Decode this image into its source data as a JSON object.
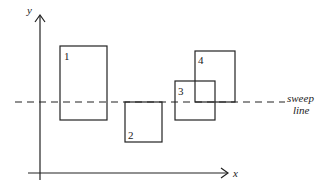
{
  "diagram": {
    "type": "sweep-line-rectangles",
    "axes": {
      "x_label": "x",
      "y_label": "y"
    },
    "sweep_line": {
      "label_line1": "sweep",
      "label_line2": "line",
      "style": "dashed"
    },
    "rectangles": [
      {
        "id": "1",
        "label": "1"
      },
      {
        "id": "2",
        "label": "2"
      },
      {
        "id": "3",
        "label": "3"
      },
      {
        "id": "4",
        "label": "4"
      }
    ],
    "colors": {
      "stroke": "#222222",
      "background": "#ffffff"
    }
  }
}
